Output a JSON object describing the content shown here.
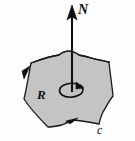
{
  "figure": {
    "background_color": "#fdfdfd",
    "labels": {
      "normal_vector": "N",
      "region": "R",
      "boundary_curve": "c"
    },
    "colors": {
      "region_fill": "#c4c4c4",
      "outline": "#1a1a1a",
      "arrow": "#101010",
      "text": "#101010"
    },
    "elements": {
      "normal_arrow_name": "normal-vector-arrow",
      "region_name": "shaded-region",
      "boundary_name": "boundary-curve",
      "circulation_name": "circulation-arrow",
      "orientation_arrow_left": "boundary-orientation-arrow-left",
      "orientation_arrow_bottom": "boundary-orientation-arrow-bottom"
    },
    "geometry": {
      "region_path": "M 24 98 L 32 64 L 60 56 Q 69 50 78 56 L 108 62 L 113 96 L 104 112 L 99 124 L 74 120 Q 60 122 48 126 Q 34 116 24 98 Z",
      "normal_arrow_x": 72,
      "normal_arrow_top_y": 6,
      "normal_arrow_bottom_y": 92,
      "circulation_center_x": 72,
      "circulation_center_y": 90,
      "circulation_rx": 11,
      "circulation_ry": 6
    }
  }
}
